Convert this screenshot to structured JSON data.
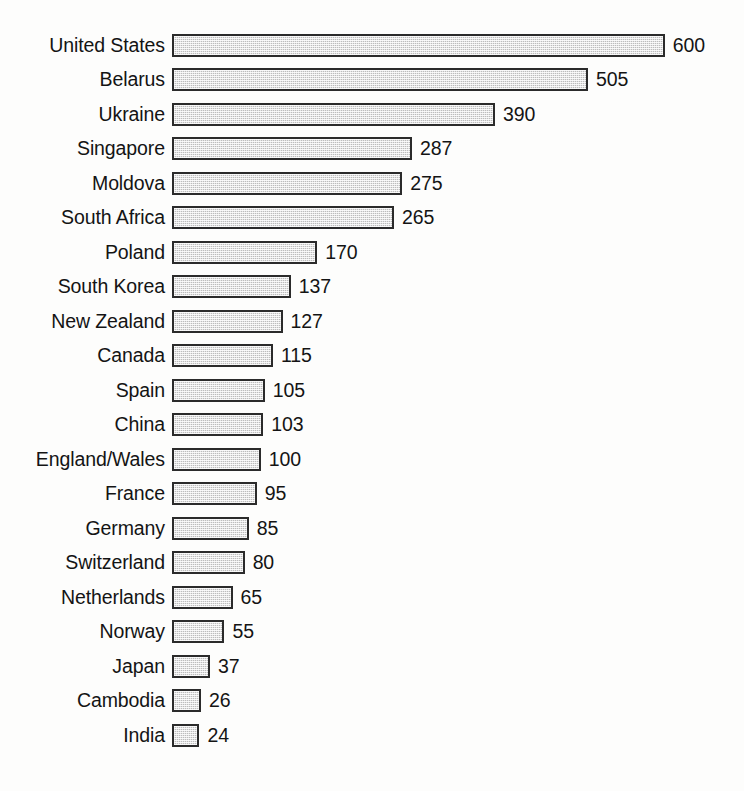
{
  "chart_data": {
    "type": "bar",
    "orientation": "horizontal",
    "title": "",
    "subtitle": "",
    "xlabel": "",
    "ylabel": "",
    "grid": false,
    "legend": "none",
    "axis_visible": false,
    "value_labels_shown": true,
    "xlim": [
      0,
      600
    ],
    "categories": [
      "United States",
      "Belarus",
      "Ukraine",
      "Singapore",
      "Moldova",
      "South Africa",
      "Poland",
      "South Korea",
      "New Zealand",
      "Canada",
      "Spain",
      "China",
      "England/Wales",
      "France",
      "Germany",
      "Switzerland",
      "Netherlands",
      "Norway",
      "Japan",
      "Cambodia",
      "India"
    ],
    "values": [
      600,
      505,
      390,
      287,
      275,
      265,
      170,
      137,
      127,
      115,
      105,
      103,
      100,
      95,
      85,
      80,
      65,
      55,
      37,
      26,
      24
    ],
    "value_labels": [
      "600",
      "505",
      "390",
      "287",
      "275",
      "265",
      "170",
      "137",
      "127",
      "115",
      "105",
      "103",
      "100",
      "95",
      "85",
      "80",
      "65",
      "55",
      "37",
      "26",
      "24"
    ],
    "colors": {
      "bar_fill": "#bdbdbd",
      "bar_border": "#2b2b2b",
      "text": "#141414",
      "background": "#fdfdfc"
    }
  }
}
